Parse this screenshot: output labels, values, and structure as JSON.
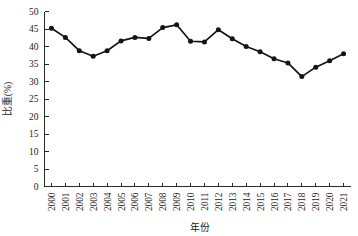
{
  "chart_data": {
    "type": "line",
    "title": "",
    "xlabel": "年份",
    "ylabel": "比重(%)",
    "ylim": [
      0,
      50
    ],
    "ytick_step": 5,
    "yticks": [
      "0",
      "5",
      "10",
      "15",
      "20",
      "25",
      "30",
      "35",
      "40",
      "45",
      "50"
    ],
    "grid": false,
    "legend": false,
    "legend_position": "none",
    "marker": "filled-circle",
    "line_color": "#141414",
    "marker_color": "#141414",
    "categories": [
      "2000",
      "2001",
      "2002",
      "2003",
      "2004",
      "2005",
      "2006",
      "2007",
      "2008",
      "2009",
      "2010",
      "2011",
      "2012",
      "2013",
      "2014",
      "2015",
      "2016",
      "2017",
      "2018",
      "2019",
      "2020",
      "2021"
    ],
    "values": [
      45.2,
      42.6,
      38.8,
      37.2,
      38.8,
      41.6,
      42.6,
      42.3,
      45.4,
      46.2,
      41.5,
      41.3,
      44.8,
      42.2,
      40.0,
      38.5,
      36.5,
      35.3,
      31.4,
      34.1,
      35.9,
      37.9
    ],
    "series": [
      {
        "name": "比重",
        "values": [
          45.2,
          42.6,
          38.8,
          37.2,
          38.8,
          41.6,
          42.6,
          42.3,
          45.4,
          46.2,
          41.5,
          41.3,
          44.8,
          42.2,
          40.0,
          38.5,
          36.5,
          35.3,
          31.4,
          34.1,
          35.9,
          37.9
        ]
      }
    ]
  }
}
